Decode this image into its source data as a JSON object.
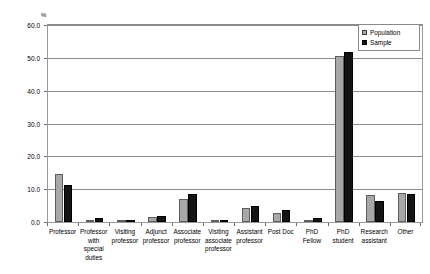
{
  "chart_data": {
    "type": "bar",
    "title": "",
    "subtitle": "",
    "xlabel": "",
    "ylabel": "%",
    "ylim": [
      0,
      60
    ],
    "ytick_labels": [
      "0.0",
      "10.0",
      "20.0",
      "30.0",
      "40.0",
      "50.0",
      "60.0"
    ],
    "yticks": [
      0,
      10,
      20,
      30,
      40,
      50,
      60
    ],
    "grid": true,
    "legend_position": "top-right",
    "categories": [
      "Professor",
      "Professor with special duties",
      "Visiting professor",
      "Adjunct professor",
      "Associate professor",
      "Visiting associate professor",
      "Assistant professor",
      "Post Doc",
      "PhD Fellow",
      "PhD student",
      "Research assistant",
      "Other"
    ],
    "category_label_lines": [
      [
        "Professor"
      ],
      [
        "Professor",
        "with",
        "special",
        "duties"
      ],
      [
        "Visiting",
        "professor"
      ],
      [
        "Adjunct",
        "professor"
      ],
      [
        "Associate",
        "professor"
      ],
      [
        "Visiting",
        "associate",
        "professor"
      ],
      [
        "Assistant",
        "professor"
      ],
      [
        "Post Doc"
      ],
      [
        "PhD",
        "Fellow"
      ],
      [
        "PhD",
        "student"
      ],
      [
        "Research",
        "assistant"
      ],
      [
        "Other"
      ]
    ],
    "series": [
      {
        "name": "Population",
        "color": "#a8a8a8",
        "values": [
          14.7,
          0.4,
          0.2,
          1.5,
          7.0,
          0.2,
          4.3,
          2.6,
          0.6,
          50.5,
          8.2,
          8.8
        ]
      },
      {
        "name": "Sample",
        "color": "#141414",
        "values": [
          11.4,
          1.3,
          0.3,
          1.7,
          8.4,
          0.5,
          4.8,
          3.8,
          1.2,
          51.7,
          6.3,
          8.5
        ]
      }
    ]
  },
  "legend": {
    "items": [
      {
        "label": "Population",
        "swatch": "population-swatch"
      },
      {
        "label": "Sample",
        "swatch": "sample-swatch"
      }
    ]
  },
  "axis": {
    "unit_label": "%"
  }
}
